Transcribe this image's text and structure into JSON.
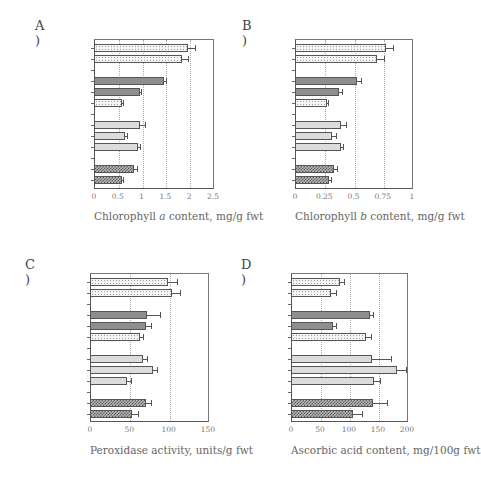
{
  "chart_data": [
    {
      "id": "A",
      "panel_label": "A )",
      "type": "bar",
      "orientation": "horizontal",
      "xlabel": "Chlorophyll a content, mg/g fwt",
      "xlim": [
        0,
        2.5
      ],
      "xticks": [
        "0",
        "0.5",
        "1",
        "1.5",
        "2",
        "2.5"
      ],
      "grid": "vertical dotted",
      "categories": [
        "Initial-1",
        "Initial-2",
        "",
        "Bringelly-1",
        "Bringelly-2",
        "Bringelly>Rozelle",
        "",
        "Rozelle-1",
        "Rozelle-2",
        "Rozelle>Bringely",
        "",
        "Lindfield-1",
        "Lindfield-2"
      ],
      "values": [
        1.97,
        1.85,
        null,
        1.47,
        0.96,
        0.58,
        null,
        0.97,
        0.66,
        0.93,
        null,
        0.85,
        0.58
      ],
      "errors": [
        0.15,
        0.12,
        null,
        0.04,
        0.03,
        0.03,
        null,
        0.1,
        0.04,
        0.03,
        null,
        0.05,
        0.03
      ]
    },
    {
      "id": "B",
      "panel_label": "B )",
      "type": "bar",
      "orientation": "horizontal",
      "xlabel": "Chlorophyll b content, mg/g fwt",
      "xlim": [
        0,
        1
      ],
      "xticks": [
        "0",
        "0.25",
        "0.5",
        "0.75",
        "1"
      ],
      "grid": "vertical dotted",
      "categories": [
        "Initial-1",
        "Initial-2",
        "",
        "Bringelly-1",
        "Bringelly-2",
        "Bringelly>Rozelle",
        "",
        "Rozelle-1",
        "Rozelle-2",
        "Rozelle>Bringely",
        "",
        "Lindfield-1",
        "Lindfield-2"
      ],
      "values": [
        0.78,
        0.7,
        null,
        0.53,
        0.38,
        0.27,
        null,
        0.39,
        0.32,
        0.39,
        null,
        0.33,
        0.29
      ],
      "errors": [
        0.06,
        0.06,
        null,
        0.03,
        0.02,
        0.01,
        null,
        0.05,
        0.03,
        0.02,
        null,
        0.03,
        0.02
      ]
    },
    {
      "id": "C",
      "panel_label": "C )",
      "type": "bar",
      "orientation": "horizontal",
      "xlabel": "Peroxidase activity, units/g fwt",
      "xlim": [
        0,
        150
      ],
      "xticks": [
        "0",
        "50",
        "100",
        "150"
      ],
      "grid": "vertical dotted",
      "categories": [
        "Control-1",
        "Control-2",
        "",
        "Bringelly-1",
        "Bringelly-2",
        "Bringelly>Rozelle",
        "",
        "Rozelle-1",
        "Rozelle-2",
        "Rozelle>Bringelly",
        "",
        "Lindfield-1",
        "Lindfield-2"
      ],
      "values": [
        99,
        104,
        null,
        72,
        71,
        63,
        null,
        67,
        80,
        47,
        null,
        71,
        54
      ],
      "errors": [
        12,
        11,
        null,
        17,
        7,
        5,
        null,
        6,
        5,
        5,
        null,
        7,
        7
      ]
    },
    {
      "id": "D",
      "panel_label": "D )",
      "type": "bar",
      "orientation": "horizontal",
      "xlabel": "Ascorbic acid content, mg/100g fwt",
      "xlim": [
        0,
        200
      ],
      "xticks": [
        "0",
        "50",
        "100",
        "150",
        "200"
      ],
      "grid": "vertical dotted",
      "categories": [
        "Control-1",
        "Control-2",
        "",
        "Bringelly-1",
        "Bringelly-2",
        "Bringelly>Rozelle",
        "",
        "Rozelle-1",
        "Rozelle-2",
        "Rozelle>Bringelly",
        "",
        "Lindfield-1",
        "Lindfield-2"
      ],
      "values": [
        84,
        69,
        null,
        136,
        72,
        129,
        null,
        139,
        182,
        143,
        null,
        141,
        107
      ],
      "errors": [
        7,
        9,
        null,
        6,
        5,
        9,
        null,
        33,
        17,
        11,
        null,
        24,
        16
      ]
    }
  ],
  "panels": {
    "A": {
      "label": "A )",
      "xlabel_pre": "Chlorophyll ",
      "xlabel_italic": "a",
      "xlabel_post": " content, mg/g fwt"
    },
    "B": {
      "label": "B )",
      "xlabel_pre": "Chlorophyll ",
      "xlabel_italic": "b",
      "xlabel_post": " content, mg/g fwt"
    },
    "C": {
      "label": "C )",
      "xlabel": "Peroxidase activity, units/g fwt"
    },
    "D": {
      "label": "D )",
      "xlabel": "Ascorbic acid content, mg/100g fwt"
    }
  },
  "colors": {
    "axis": "#555555",
    "grid": "#aaaaaa",
    "text": "#666666"
  }
}
